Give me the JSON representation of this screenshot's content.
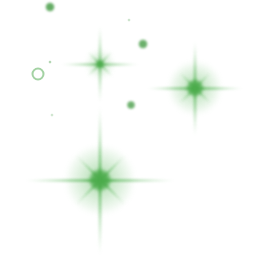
{
  "artwork": {
    "title": "Green Sparkles",
    "width": 256,
    "height": 269,
    "background_color": "#ffffff",
    "accent_color": "#4aa94a",
    "core_color": "#4bab4b",
    "ray_color": "#63bb63",
    "dot_color": "#4a9e4a",
    "ring_color": "#7cbf7c"
  },
  "chart_data": {
    "type": "scatter",
    "xlabel": "",
    "ylabel": "",
    "xlim": [
      0,
      256
    ],
    "ylim": [
      0,
      269
    ],
    "grid": false,
    "legend": "none",
    "series": [
      {
        "name": "sparkles",
        "marker": "8-point-star",
        "points": [
          {
            "label": "sparkle-upper-left",
            "x": 100,
            "y": 64,
            "size": 78,
            "intensity": 0.72,
            "core": 9
          },
          {
            "label": "sparkle-right",
            "x": 195,
            "y": 88,
            "size": 96,
            "intensity": 0.95,
            "core": 17
          },
          {
            "label": "sparkle-bottom-center",
            "x": 100,
            "y": 180,
            "size": 150,
            "intensity": 1.0,
            "core": 22
          }
        ]
      },
      {
        "name": "dots",
        "marker": "filled-circle",
        "points": [
          {
            "label": "dot-top-left",
            "x": 50,
            "y": 7,
            "size": 9,
            "intensity": 0.92
          },
          {
            "label": "dot-upper-right",
            "x": 143,
            "y": 44,
            "size": 9,
            "intensity": 0.88
          },
          {
            "label": "dot-mid-right",
            "x": 131,
            "y": 105,
            "size": 8,
            "intensity": 0.86
          },
          {
            "label": "dot-tiny-top",
            "x": 129,
            "y": 20,
            "size": 3,
            "intensity": 0.3
          },
          {
            "label": "dot-tiny-left",
            "x": 52,
            "y": 115,
            "size": 3,
            "intensity": 0.28
          },
          {
            "label": "dot-tiny-above-ring",
            "x": 50,
            "y": 62,
            "size": 3,
            "intensity": 0.45
          }
        ]
      },
      {
        "name": "rings",
        "marker": "open-circle",
        "points": [
          {
            "label": "ring-left",
            "x": 38,
            "y": 74,
            "size": 13,
            "stroke": 2,
            "intensity": 0.7
          }
        ]
      }
    ]
  }
}
